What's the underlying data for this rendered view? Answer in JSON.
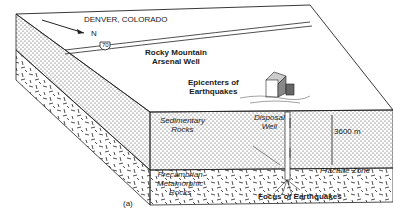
{
  "diagram": {
    "location_label": "DENVER, COLORADO",
    "north_label": "N",
    "highway_shield": "70",
    "well_label_line1": "Rocky Mountain",
    "well_label_line2": "Arsenal Well",
    "epicenters_line1": "Epicenters of",
    "epicenters_line2": "Earthquakes",
    "sedimentary_line1": "Sedimentary",
    "sedimentary_line2": "Rocks",
    "disposal_line1": "Disposal",
    "disposal_line2": "Well",
    "depth_label": "3600 m",
    "precambrian_line1": "Precambrian",
    "precambrian_line2": "Metamorphic",
    "precambrian_line3": "Rocks",
    "fracture_label": "Fracture Zone",
    "focus_label": "Focus of Earthquakes",
    "panel_label": "(a)"
  },
  "colors": {
    "ink": "#1a1a1a",
    "paper": "#ffffff"
  }
}
